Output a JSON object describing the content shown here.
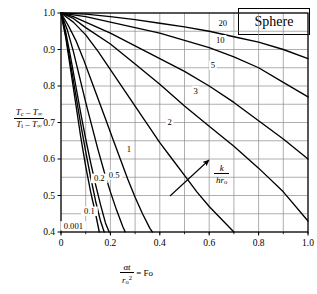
{
  "chart_data": {
    "type": "line",
    "title": "Sphere",
    "title_box": "Sphere",
    "xlabel": "αt/r_o² = Fo",
    "xlabel_parts": {
      "num": "αt",
      "den": "r",
      "den_sub": "o",
      "den_sup": "2",
      "eq": "= Fo"
    },
    "ylabel": "(T_c − T_∞)/(T_i − T_∞)",
    "ylabel_parts": {
      "num_a": "T",
      "num_a_sub": "c",
      "num_minus": "–",
      "num_b": "T",
      "num_b_sub": "∞",
      "den_a": "T",
      "den_a_sub": "i",
      "den_minus": "–",
      "den_b": "T",
      "den_b_sub": "∞"
    },
    "xlim": [
      0,
      1.0
    ],
    "ylim": [
      0.4,
      1.0
    ],
    "xticks": [
      "0",
      "0.2",
      "0.4",
      "0.6",
      "0.8",
      "1.0"
    ],
    "xtick_values": [
      0,
      0.2,
      0.4,
      0.6,
      0.8,
      1.0
    ],
    "yticks": [
      "0.4",
      "0.5",
      "0.6",
      "0.7",
      "0.8",
      "0.9",
      "1.0"
    ],
    "ytick_values": [
      0.4,
      0.5,
      0.6,
      0.7,
      0.8,
      0.9,
      1.0
    ],
    "grid": true,
    "grid_x_step": 0.1,
    "grid_y_step": 0.05,
    "legend": "none",
    "annotation": {
      "arrow_label": "k/(hr_o)",
      "arrow_label_num": "k",
      "arrow_label_den": "hr",
      "arrow_label_den_sub": "o",
      "arrow_direction": "up-right",
      "meaning": "increasing k/hr_o"
    },
    "series": [
      {
        "name": "0.001",
        "label": "0.001",
        "points": [
          [
            0,
            1.0
          ],
          [
            0.02,
            0.93
          ],
          [
            0.04,
            0.84
          ],
          [
            0.06,
            0.75
          ],
          [
            0.08,
            0.66
          ],
          [
            0.1,
            0.58
          ],
          [
            0.12,
            0.51
          ],
          [
            0.14,
            0.45
          ],
          [
            0.155,
            0.4
          ]
        ]
      },
      {
        "name": "0.1",
        "label": "0.1",
        "points": [
          [
            0,
            1.0
          ],
          [
            0.02,
            0.935
          ],
          [
            0.04,
            0.855
          ],
          [
            0.06,
            0.775
          ],
          [
            0.08,
            0.695
          ],
          [
            0.1,
            0.62
          ],
          [
            0.12,
            0.55
          ],
          [
            0.14,
            0.485
          ],
          [
            0.16,
            0.43
          ],
          [
            0.175,
            0.4
          ]
        ]
      },
      {
        "name": "0.2",
        "label": "0.2",
        "points": [
          [
            0,
            1.0
          ],
          [
            0.02,
            0.945
          ],
          [
            0.04,
            0.875
          ],
          [
            0.06,
            0.8
          ],
          [
            0.08,
            0.725
          ],
          [
            0.1,
            0.655
          ],
          [
            0.12,
            0.59
          ],
          [
            0.14,
            0.53
          ],
          [
            0.16,
            0.475
          ],
          [
            0.18,
            0.425
          ],
          [
            0.195,
            0.4
          ]
        ]
      },
      {
        "name": "0.5",
        "label": "0.5",
        "points": [
          [
            0,
            1.0
          ],
          [
            0.025,
            0.955
          ],
          [
            0.05,
            0.895
          ],
          [
            0.075,
            0.825
          ],
          [
            0.1,
            0.755
          ],
          [
            0.125,
            0.69
          ],
          [
            0.15,
            0.625
          ],
          [
            0.175,
            0.565
          ],
          [
            0.2,
            0.51
          ],
          [
            0.225,
            0.46
          ],
          [
            0.25,
            0.415
          ],
          [
            0.26,
            0.4
          ]
        ]
      },
      {
        "name": "1",
        "label": "1",
        "points": [
          [
            0,
            1.0
          ],
          [
            0.03,
            0.965
          ],
          [
            0.06,
            0.925
          ],
          [
            0.09,
            0.875
          ],
          [
            0.12,
            0.82
          ],
          [
            0.15,
            0.765
          ],
          [
            0.18,
            0.71
          ],
          [
            0.21,
            0.655
          ],
          [
            0.24,
            0.6
          ],
          [
            0.27,
            0.545
          ],
          [
            0.3,
            0.495
          ],
          [
            0.33,
            0.45
          ],
          [
            0.36,
            0.41
          ],
          [
            0.37,
            0.4
          ]
        ]
      },
      {
        "name": "2",
        "label": "2",
        "points": [
          [
            0,
            1.0
          ],
          [
            0.05,
            0.975
          ],
          [
            0.1,
            0.94
          ],
          [
            0.15,
            0.895
          ],
          [
            0.2,
            0.845
          ],
          [
            0.25,
            0.795
          ],
          [
            0.3,
            0.745
          ],
          [
            0.35,
            0.695
          ],
          [
            0.4,
            0.645
          ],
          [
            0.45,
            0.6
          ],
          [
            0.5,
            0.555
          ],
          [
            0.55,
            0.51
          ],
          [
            0.6,
            0.47
          ],
          [
            0.65,
            0.435
          ],
          [
            0.7,
            0.4
          ]
        ]
      },
      {
        "name": "3",
        "label": "3",
        "points": [
          [
            0,
            1.0
          ],
          [
            0.05,
            0.985
          ],
          [
            0.1,
            0.96
          ],
          [
            0.2,
            0.915
          ],
          [
            0.3,
            0.86
          ],
          [
            0.4,
            0.805
          ],
          [
            0.5,
            0.745
          ],
          [
            0.6,
            0.69
          ],
          [
            0.7,
            0.635
          ],
          [
            0.8,
            0.575
          ],
          [
            0.9,
            0.51
          ],
          [
            1.0,
            0.43
          ]
        ]
      },
      {
        "name": "5",
        "label": "5",
        "points": [
          [
            0,
            1.0
          ],
          [
            0.05,
            0.99
          ],
          [
            0.1,
            0.975
          ],
          [
            0.2,
            0.945
          ],
          [
            0.3,
            0.91
          ],
          [
            0.4,
            0.875
          ],
          [
            0.5,
            0.84
          ],
          [
            0.6,
            0.8
          ],
          [
            0.7,
            0.755
          ],
          [
            0.8,
            0.705
          ],
          [
            0.9,
            0.655
          ],
          [
            1.0,
            0.6
          ]
        ]
      },
      {
        "name": "10",
        "label": "10",
        "points": [
          [
            0,
            1.0
          ],
          [
            0.05,
            0.995
          ],
          [
            0.1,
            0.99
          ],
          [
            0.2,
            0.975
          ],
          [
            0.3,
            0.96
          ],
          [
            0.4,
            0.945
          ],
          [
            0.5,
            0.925
          ],
          [
            0.6,
            0.905
          ],
          [
            0.7,
            0.88
          ],
          [
            0.8,
            0.85
          ],
          [
            0.9,
            0.81
          ],
          [
            1.0,
            0.77
          ]
        ]
      },
      {
        "name": "20",
        "label": "20",
        "points": [
          [
            0,
            1.0
          ],
          [
            0.1,
            0.997
          ],
          [
            0.2,
            0.99
          ],
          [
            0.3,
            0.982
          ],
          [
            0.4,
            0.972
          ],
          [
            0.5,
            0.962
          ],
          [
            0.6,
            0.95
          ],
          [
            0.7,
            0.935
          ],
          [
            0.8,
            0.92
          ],
          [
            0.9,
            0.9
          ],
          [
            1.0,
            0.875
          ]
        ]
      }
    ],
    "curve_labels": [
      {
        "text": "0.001",
        "x": 0.05,
        "y": 0.415
      },
      {
        "text": "0.1",
        "x": 0.115,
        "y": 0.455
      },
      {
        "text": "0.2",
        "x": 0.155,
        "y": 0.545
      },
      {
        "text": "0.5",
        "x": 0.215,
        "y": 0.555
      },
      {
        "text": "1",
        "x": 0.275,
        "y": 0.625
      },
      {
        "text": "2",
        "x": 0.44,
        "y": 0.7
      },
      {
        "text": "3",
        "x": 0.545,
        "y": 0.785
      },
      {
        "text": "5",
        "x": 0.615,
        "y": 0.855
      },
      {
        "text": "10",
        "x": 0.645,
        "y": 0.925
      },
      {
        "text": "20",
        "x": 0.655,
        "y": 0.97
      }
    ]
  }
}
